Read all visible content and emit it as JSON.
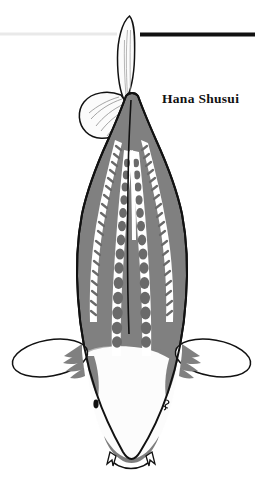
{
  "figure": {
    "title": "Hana Shusui",
    "variety_label": "Hana Shusui",
    "background_color": "#ffffff",
    "ink_color": "#111111",
    "body_gray": "#808080",
    "scale_gray": "#6a6a6a",
    "fin_white": "#fbfbfb",
    "rule_gray": "#e9e9e9",
    "rule_black": "#111111"
  },
  "rules": {
    "left_rule": {
      "name": "light-gray-rule",
      "color": "#e9e9e9",
      "x1": 0,
      "x2": 116,
      "y": 34,
      "thickness": 3
    },
    "right_rule": {
      "name": "black-rule",
      "color": "#111111",
      "x1": 140,
      "x2": 255,
      "y": 34,
      "thickness": 4
    }
  },
  "fish": {
    "orientation": "head-down-tail-up",
    "parts": [
      {
        "name": "caudal-fin",
        "label": "Caudal fin (tail)"
      },
      {
        "name": "dorsal-fin",
        "label": "Dorsal fin"
      },
      {
        "name": "body",
        "label": "Body"
      },
      {
        "name": "pectoral-fin-left",
        "label": "Left pectoral fin"
      },
      {
        "name": "pectoral-fin-right",
        "label": "Right pectoral fin"
      },
      {
        "name": "head",
        "label": "Head"
      },
      {
        "name": "eye-left",
        "label": "Left eye"
      },
      {
        "name": "eye-right",
        "label": "Right eye"
      },
      {
        "name": "mouth",
        "label": "Mouth"
      },
      {
        "name": "barbels",
        "label": "Barbels"
      },
      {
        "name": "scale-rows",
        "label": "Doitsu dorsal scale rows"
      }
    ],
    "scale_rows": {
      "count": 4,
      "description": "Two inner large-scale rows flanked by two outer fine-scale rows"
    }
  }
}
